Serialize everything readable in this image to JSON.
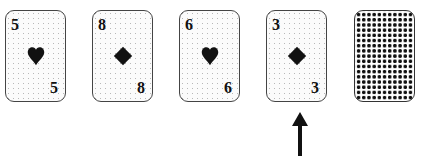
{
  "cards": [
    {
      "rank": "5",
      "suit": "heart",
      "face": "up"
    },
    {
      "rank": "8",
      "suit": "diamond",
      "face": "up"
    },
    {
      "rank": "6",
      "suit": "heart",
      "face": "up"
    },
    {
      "rank": "3",
      "suit": "diamond",
      "face": "up"
    },
    {
      "face": "down"
    }
  ],
  "pointer": {
    "target_card_index": 3,
    "icon": "up-arrow-icon"
  }
}
